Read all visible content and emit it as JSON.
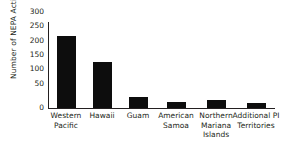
{
  "chart_data": {
    "type": "bar",
    "title": "",
    "subtitle": "",
    "xlabel": "",
    "ylabel": "Number of NEPA Actions",
    "categories": [
      "Western Pacific",
      "Hawaii",
      "Guam",
      "American Samoa",
      "Northern Mariana Islands",
      "Additional PI Territories"
    ],
    "category_lines": [
      [
        "Western",
        "Pacific"
      ],
      [
        "Hawaii"
      ],
      [
        "Guam"
      ],
      [
        "American",
        "Samoa"
      ],
      [
        "Northern",
        "Mariana",
        "Islands"
      ],
      [
        "Additional PI",
        "Territories"
      ]
    ],
    "values": [
      250,
      160,
      39,
      20,
      29,
      17
    ],
    "ylim": [
      0,
      300
    ],
    "ytick_values": [
      300,
      250,
      200,
      150,
      100,
      50,
      0
    ],
    "ytick_labels": [
      "300",
      "250",
      "200",
      "150",
      "100",
      "50",
      "0"
    ],
    "grid": false,
    "legend": null,
    "bar_color": "#0d0d0d",
    "axis_color": "#231f20",
    "background_color": "#ffffff"
  }
}
